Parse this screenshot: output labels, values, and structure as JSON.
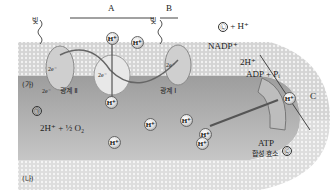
{
  "diagram": {
    "regions": {
      "stroma_label": "(가)",
      "lumen_label": "(나)"
    },
    "brackets": {
      "A": "A",
      "B": "B",
      "C": "C"
    },
    "light_labels": [
      "빛",
      "빛"
    ],
    "photosystem_2": "광계 Ⅱ",
    "photosystem_1": "광계 Ⅰ",
    "electrons": [
      "2e⁻",
      "2e⁻",
      "2e⁻",
      "2e⁻"
    ],
    "water_split": {
      "marker": "㉠",
      "products": "2H⁺ + ½ O₂"
    },
    "nadp": {
      "reactant": "NADP⁺",
      "added": "2H⁺",
      "product_marker": "㉡",
      "product_extra": "+ H⁺"
    },
    "atp_synthase": {
      "substrates": "ADP + Pᵢ",
      "product_marker": "㉢",
      "label_line1": "ATP",
      "label_line2": "합성 효소"
    },
    "h_ion": "H⁺",
    "colors": {
      "membrane": "#b8b8b8",
      "stroma_bg": "#d8d8d8",
      "lumen_bg": "#a9a9a9",
      "protein": "#e6e6e6",
      "arrow": "#555555"
    }
  }
}
